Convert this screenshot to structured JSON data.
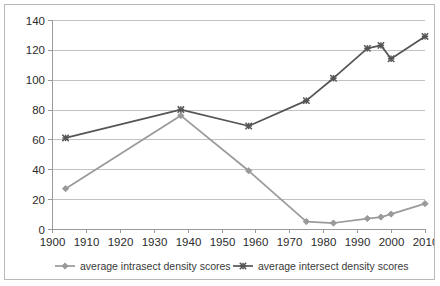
{
  "chart_data": {
    "type": "line",
    "title": "",
    "xlabel": "",
    "ylabel": "",
    "xlim": [
      1900,
      2010
    ],
    "ylim": [
      0,
      140
    ],
    "xticks": [
      1900,
      1910,
      1920,
      1930,
      1940,
      1950,
      1960,
      1970,
      1980,
      1990,
      2000,
      2010
    ],
    "yticks": [
      0,
      20,
      40,
      60,
      80,
      100,
      120,
      140
    ],
    "grid": "horizontal",
    "legend_position": "bottom",
    "series": [
      {
        "name": "average intrasect density scores",
        "color": "#9a9a9a",
        "marker": "diamond",
        "x": [
          1904,
          1938,
          1958,
          1975,
          1983,
          1993,
          1997,
          2000,
          2010
        ],
        "values": [
          27,
          76,
          39,
          5,
          4,
          7,
          8,
          10,
          17
        ]
      },
      {
        "name": "average intersect density scores",
        "color": "#555555",
        "marker": "cross",
        "x": [
          1904,
          1938,
          1958,
          1975,
          1983,
          1993,
          1997,
          2000,
          2010
        ],
        "values": [
          61,
          80,
          69,
          86,
          101,
          121,
          123,
          114,
          129
        ]
      }
    ]
  },
  "axis": {
    "y_tick_labels": [
      "0",
      "20",
      "40",
      "60",
      "80",
      "100",
      "120",
      "140"
    ],
    "x_tick_labels": [
      "1900",
      "1910",
      "1920",
      "1930",
      "1940",
      "1950",
      "1960",
      "1970",
      "1980",
      "1990",
      "2000",
      "2010"
    ]
  },
  "legend": {
    "items": [
      {
        "label": "average intrasect density scores"
      },
      {
        "label": "average intersect density scores"
      }
    ]
  }
}
